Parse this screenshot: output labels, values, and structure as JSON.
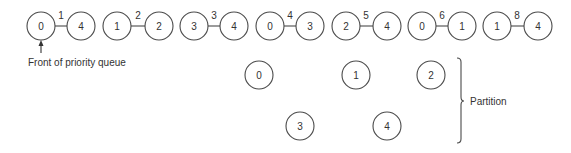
{
  "diagram": {
    "priority_queue": {
      "edges": [
        {
          "from": "0",
          "to": "4",
          "weight": "1",
          "x1": 41,
          "x2": 81
        },
        {
          "from": "1",
          "to": "2",
          "weight": "2",
          "x1": 117,
          "x2": 159
        },
        {
          "from": "3",
          "to": "4",
          "weight": "3",
          "x1": 194,
          "x2": 234
        },
        {
          "from": "0",
          "to": "3",
          "weight": "4",
          "x1": 270,
          "x2": 310
        },
        {
          "from": "2",
          "to": "4",
          "weight": "5",
          "x1": 346,
          "x2": 387
        },
        {
          "from": "0",
          "to": "1",
          "weight": "6",
          "x1": 422,
          "x2": 462
        },
        {
          "from": "1",
          "to": "4",
          "weight": "8",
          "x1": 497,
          "x2": 538
        }
      ],
      "front_label": "Front of priority queue"
    },
    "partition": {
      "label": "Partition",
      "nodes": [
        {
          "id": "0",
          "cx": 259,
          "cy": 75
        },
        {
          "id": "1",
          "cx": 356,
          "cy": 75
        },
        {
          "id": "2",
          "cx": 431,
          "cy": 75
        },
        {
          "id": "3",
          "cx": 300,
          "cy": 126
        },
        {
          "id": "4",
          "cx": 387,
          "cy": 126
        }
      ]
    },
    "colors": {
      "stroke": "#4a4a4a",
      "text": "#333333",
      "background": "#ffffff"
    }
  }
}
